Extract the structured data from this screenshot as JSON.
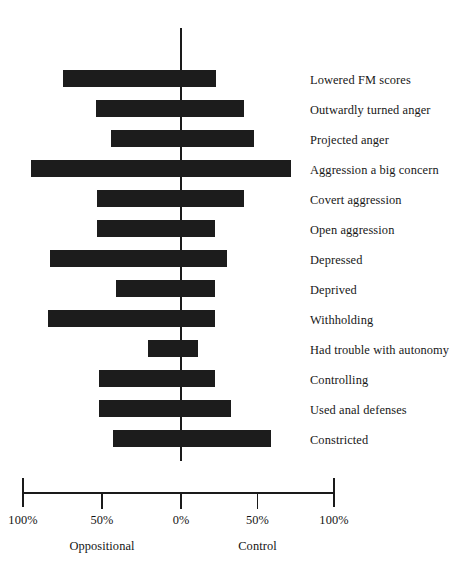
{
  "chart_data": {
    "type": "bar",
    "orientation": "horizontal",
    "subtype": "diverging-bar",
    "title": "",
    "subtitle": "",
    "xlabel": "",
    "ylabel": "",
    "xlim": [
      -100,
      100
    ],
    "grid": false,
    "legend": false,
    "axis_tick_labels": [
      "100%",
      "50%",
      "0%",
      "50%",
      "100%"
    ],
    "axis_tick_values": [
      -100,
      -50,
      0,
      50,
      100
    ],
    "group_labels": [
      {
        "text": "Oppositional",
        "value": -50
      },
      {
        "text": "Control",
        "value": 50
      }
    ],
    "bar_color": "#1c1c1c",
    "axis_color": "#1a1a1a",
    "categories": [
      "Lowered FM scores",
      "Outwardly turned anger",
      "Projected anger",
      "Aggression a big concern",
      "Covert aggression",
      "Open aggression",
      "Depressed",
      "Deprived",
      "Withholding",
      "Had trouble with autonomy",
      "Controlling",
      "Used anal defenses",
      "Constricted"
    ],
    "series": [
      {
        "name": "Oppositional",
        "side": "left",
        "values": [
          75,
          54,
          44,
          95,
          53,
          53,
          83,
          41,
          84,
          21,
          52,
          52,
          43
        ]
      },
      {
        "name": "Control",
        "side": "right",
        "values": [
          23,
          41,
          48,
          72,
          41,
          22,
          30,
          22,
          22,
          11,
          22,
          33,
          59
        ]
      }
    ],
    "bars": [
      {
        "label": "Lowered FM scores",
        "left": 75,
        "right": 23
      },
      {
        "label": "Outwardly turned anger",
        "left": 54,
        "right": 41
      },
      {
        "label": "Projected anger",
        "left": 44,
        "right": 48
      },
      {
        "label": "Aggression a big concern",
        "left": 95,
        "right": 72
      },
      {
        "label": "Covert aggression",
        "left": 53,
        "right": 41
      },
      {
        "label": "Open aggression",
        "left": 53,
        "right": 22
      },
      {
        "label": "Depressed",
        "left": 83,
        "right": 30
      },
      {
        "label": "Deprived",
        "left": 41,
        "right": 22
      },
      {
        "label": "Withholding",
        "left": 84,
        "right": 22
      },
      {
        "label": "Had trouble with autonomy",
        "left": 21,
        "right": 11
      },
      {
        "label": "Controlling",
        "left": 52,
        "right": 22
      },
      {
        "label": "Used anal defenses",
        "left": 52,
        "right": 33
      },
      {
        "label": "Constricted",
        "left": 43,
        "right": 59
      }
    ]
  },
  "layout": {
    "zero_x_px": 181,
    "px_per_pct_left": 1.58,
    "px_per_pct_right": 1.53,
    "first_bar_top_px": 70,
    "row_pitch_px": 30,
    "bar_height_px": 17
  }
}
